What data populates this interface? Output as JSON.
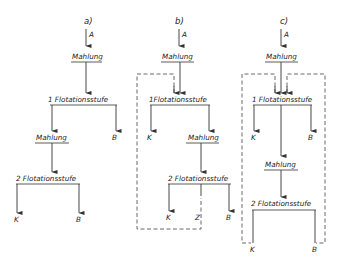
{
  "diagram": {
    "type": "flotation-flowsheets",
    "panels": [
      {
        "id": "a",
        "title": "a)",
        "feed": "A",
        "nodes": {
          "grind1": "Mahlung",
          "stage1": "1 Flotationsstufe",
          "grind2": "Mahlung",
          "stage2": "2 Flotationsstufe"
        },
        "outputs": {
          "stage1_tail": "B",
          "stage2_conc": "K",
          "stage2_tail": "B"
        }
      },
      {
        "id": "b",
        "title": "b)",
        "feed": "A",
        "nodes": {
          "grind1": "Mahlung",
          "stage1": "1Flotationsstufe",
          "grind2": "Mahlung",
          "stage2": "2 Flotationsstufe"
        },
        "outputs": {
          "stage1_conc": "K",
          "stage2_conc": "K",
          "stage2_mid": "Z",
          "stage2_tail": "B"
        },
        "recycle": "Z returned (dashed) to 1 Flotationsstufe"
      },
      {
        "id": "c",
        "title": "c)",
        "feed": "A",
        "nodes": {
          "grind1": "Mahlung",
          "stage1": "1 Flotationsstufe",
          "grind2": "Mahlung",
          "stage2": "2 Flotationsstufe"
        },
        "outputs": {
          "stage1_conc": "K",
          "stage1_tail": "B",
          "stage2_conc": "K",
          "stage2_tail": "B"
        },
        "recycle": "K and B of 2 Flotationsstufe returned (dashed) to 1 Flotationsstufe"
      }
    ]
  }
}
